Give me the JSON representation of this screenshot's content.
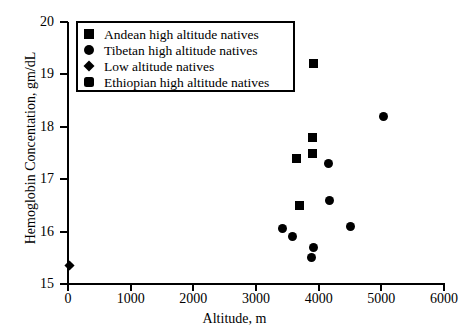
{
  "chart_data": {
    "type": "scatter",
    "title": "",
    "xlabel": "Altitude, m",
    "ylabel": "Hemoglobin Concentation, gm/dL",
    "xlim": [
      0,
      6000
    ],
    "ylim": [
      15,
      20
    ],
    "xticks": [
      0,
      1000,
      2000,
      3000,
      4000,
      5000,
      6000
    ],
    "yticks": [
      15,
      16,
      17,
      18,
      19,
      20
    ],
    "xtick_labels": [
      "0",
      "1000",
      "2000",
      "3000",
      "4000",
      "5000",
      "6000"
    ],
    "ytick_labels": [
      "15",
      "16",
      "17",
      "18",
      "19",
      "20"
    ],
    "grid": false,
    "legend_position": "upper-left",
    "series": [
      {
        "name": "Andean high altitude natives",
        "marker": "square",
        "color": "#000000",
        "points": [
          {
            "x": 3920,
            "y": 19.2
          },
          {
            "x": 3900,
            "y": 17.8
          },
          {
            "x": 3900,
            "y": 17.5
          },
          {
            "x": 3650,
            "y": 17.4
          },
          {
            "x": 3690,
            "y": 16.5
          }
        ]
      },
      {
        "name": "Tibetan high altitude natives",
        "marker": "circle",
        "color": "#000000",
        "points": [
          {
            "x": 5030,
            "y": 18.2
          },
          {
            "x": 4150,
            "y": 17.3
          },
          {
            "x": 4180,
            "y": 16.6
          },
          {
            "x": 4500,
            "y": 16.1
          },
          {
            "x": 3420,
            "y": 16.05
          },
          {
            "x": 3580,
            "y": 15.9
          },
          {
            "x": 3920,
            "y": 15.7
          },
          {
            "x": 3880,
            "y": 15.5
          }
        ]
      },
      {
        "name": "Low altitude natives",
        "marker": "diamond",
        "color": "#000000",
        "points": [
          {
            "x": 30,
            "y": 15.35
          }
        ]
      },
      {
        "name": "Ethiopian high altitude natives",
        "marker": "rounded-square",
        "color": "#000000",
        "points": []
      }
    ]
  },
  "legend": {
    "items": [
      {
        "label": "Andean high altitude natives",
        "marker": "square"
      },
      {
        "label": "Tibetan high altitude natives",
        "marker": "circle"
      },
      {
        "label": "Low altitude natives",
        "marker": "diamond"
      },
      {
        "label": "Ethiopian high altitude natives",
        "marker": "rounded-square"
      }
    ]
  }
}
